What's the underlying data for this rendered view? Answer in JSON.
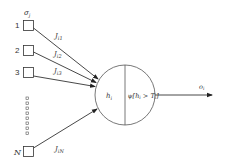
{
  "diagram": {
    "inputs": [
      {
        "label": "1",
        "weight": "J_i1",
        "weight_main": "J",
        "weight_sub": "i1"
      },
      {
        "label": "2",
        "weight": "J_i2",
        "weight_main": "J",
        "weight_sub": "i2"
      },
      {
        "label": "3",
        "weight": "J_i3",
        "weight_main": "J",
        "weight_sub": "i3"
      },
      {
        "label": "N",
        "weight": "J_iN",
        "weight_main": "J",
        "weight_sub": "iN"
      }
    ],
    "input_state_label": {
      "main": "σ",
      "sub": "j"
    },
    "ellipsis_count": 8,
    "neuron": {
      "field_label": {
        "main": "h",
        "sub": "i"
      },
      "activation_label": {
        "prefix": "ψ[",
        "h": "h",
        "h_sub": "i",
        "op": " > ",
        "t": "T",
        "t_sub": "i",
        "suffix": "]"
      }
    },
    "output_label": {
      "main": "o",
      "sub": "i"
    },
    "colors": {
      "stroke": "#333333",
      "background": "#ffffff"
    }
  }
}
